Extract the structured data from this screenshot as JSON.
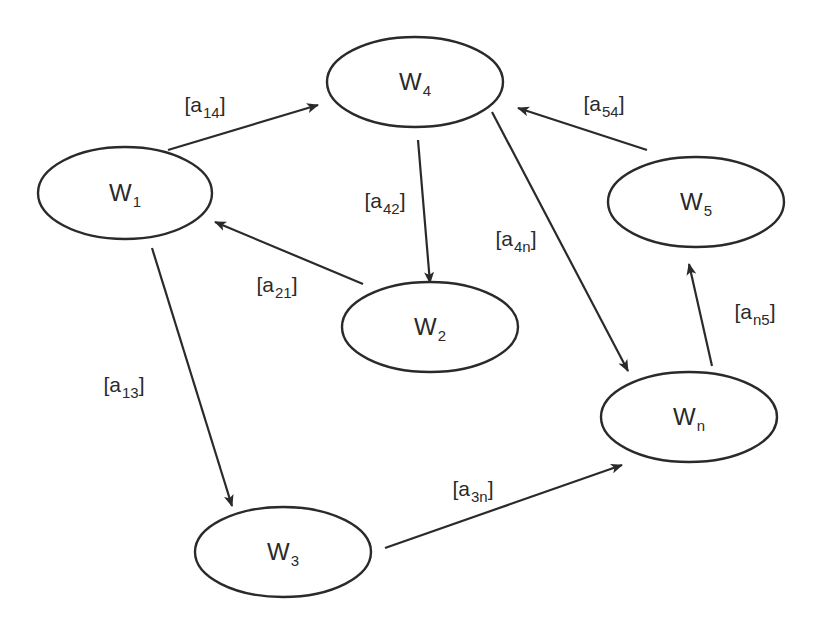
{
  "diagram": {
    "type": "directed-graph",
    "colors": {
      "stroke": "#2a2a2a",
      "background": "#ffffff",
      "text": "#2a2a2a"
    },
    "nodes": [
      {
        "id": "w1",
        "base": "W",
        "sub": "1",
        "cx": 125,
        "cy": 193,
        "rx": 87,
        "ry": 46
      },
      {
        "id": "w4",
        "base": "W",
        "sub": "4",
        "cx": 415,
        "cy": 82,
        "rx": 88,
        "ry": 45
      },
      {
        "id": "w2",
        "base": "W",
        "sub": "2",
        "cx": 430,
        "cy": 327,
        "rx": 88,
        "ry": 45
      },
      {
        "id": "w5",
        "base": "W",
        "sub": "5",
        "cx": 696,
        "cy": 202,
        "rx": 88,
        "ry": 45
      },
      {
        "id": "wn",
        "base": "W",
        "sub": "n",
        "cx": 689,
        "cy": 417,
        "rx": 88,
        "ry": 45
      },
      {
        "id": "w3",
        "base": "W",
        "sub": "3",
        "cx": 283,
        "cy": 552,
        "rx": 88,
        "ry": 45
      }
    ],
    "edges": [
      {
        "id": "a14",
        "from": "w1",
        "to": "w4",
        "label_base": "[a",
        "label_sub": "14",
        "label_close": "]",
        "x1": 168,
        "y1": 150,
        "x2": 318,
        "y2": 105,
        "lx": 205,
        "ly": 104
      },
      {
        "id": "a42",
        "from": "w4",
        "to": "w2",
        "label_base": "[a",
        "label_sub": "42",
        "label_close": "]",
        "x1": 418,
        "y1": 140,
        "x2": 430,
        "y2": 283,
        "lx": 385,
        "ly": 200
      },
      {
        "id": "a21",
        "from": "w2",
        "to": "w1",
        "label_base": "[a",
        "label_sub": "21",
        "label_close": "]",
        "x1": 363,
        "y1": 284,
        "x2": 215,
        "y2": 222,
        "lx": 277,
        "ly": 284
      },
      {
        "id": "a4n",
        "from": "w4",
        "to": "wn",
        "label_base": "[a",
        "label_sub": "4n",
        "label_close": "]",
        "x1": 492,
        "y1": 112,
        "x2": 628,
        "y2": 371,
        "lx": 516,
        "ly": 238
      },
      {
        "id": "a54",
        "from": "w5",
        "to": "w4",
        "label_base": "[a",
        "label_sub": "54",
        "label_close": "]",
        "x1": 647,
        "y1": 150,
        "x2": 518,
        "y2": 108,
        "lx": 604,
        "ly": 103
      },
      {
        "id": "an5",
        "from": "wn",
        "to": "w5",
        "label_base": "[a",
        "label_sub": "n5",
        "label_close": "]",
        "x1": 712,
        "y1": 366,
        "x2": 689,
        "y2": 264,
        "lx": 755,
        "ly": 311
      },
      {
        "id": "a13",
        "from": "w1",
        "to": "w3",
        "label_base": "[a",
        "label_sub": "13",
        "label_close": "]",
        "x1": 152,
        "y1": 248,
        "x2": 232,
        "y2": 506,
        "lx": 124,
        "ly": 384
      },
      {
        "id": "a3n",
        "from": "w3",
        "to": "wn",
        "label_base": "[a",
        "label_sub": "3n",
        "label_close": "]",
        "x1": 385,
        "y1": 548,
        "x2": 622,
        "y2": 465,
        "lx": 473,
        "ly": 488
      }
    ]
  }
}
